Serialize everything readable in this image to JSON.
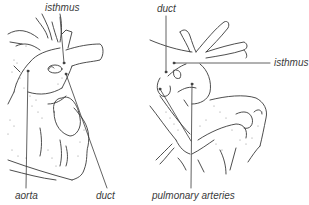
{
  "figure": {
    "left_panel": {
      "labels": {
        "isthmus": "isthmus",
        "aorta": "aorta",
        "duct": "duct"
      }
    },
    "right_panel": {
      "labels": {
        "duct": "duct",
        "isthmus": "isthmus",
        "pulmonary_arteries": "pulmonary arteries"
      }
    }
  },
  "colors": {
    "line": "#3a3a3a",
    "background": "#ffffff"
  }
}
